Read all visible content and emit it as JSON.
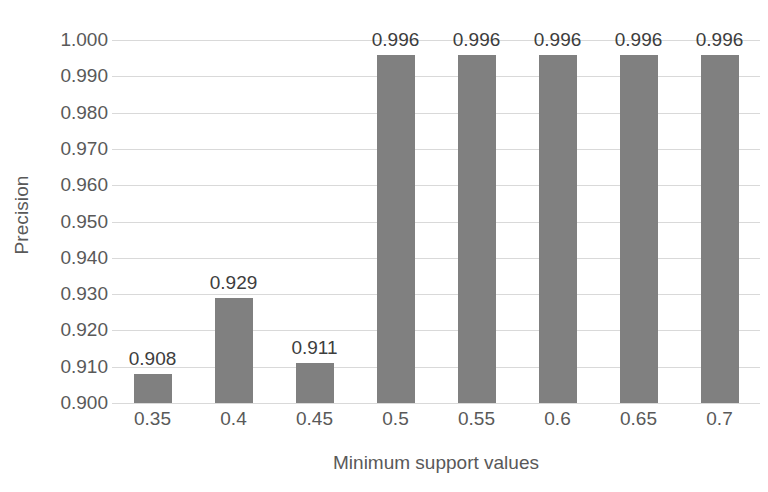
{
  "chart_data": {
    "type": "bar",
    "title": "",
    "xlabel": "Minimum support values",
    "ylabel": "Precision",
    "categories": [
      "0.35",
      "0.4",
      "0.45",
      "0.5",
      "0.55",
      "0.6",
      "0.65",
      "0.7"
    ],
    "values": [
      0.908,
      0.929,
      0.911,
      0.996,
      0.996,
      0.996,
      0.996,
      0.996
    ],
    "value_labels": [
      "0.908",
      "0.929",
      "0.911",
      "0.996",
      "0.996",
      "0.996",
      "0.996",
      "0.996"
    ],
    "ylim": [
      0.9,
      1.0
    ],
    "ytick_labels": [
      "1.000",
      "0.990",
      "0.980",
      "0.970",
      "0.960",
      "0.950",
      "0.940",
      "0.930",
      "0.920",
      "0.910",
      "0.900"
    ],
    "ytick_values": [
      1.0,
      0.99,
      0.98,
      0.97,
      0.96,
      0.95,
      0.94,
      0.93,
      0.92,
      0.91,
      0.9
    ],
    "grid": true,
    "legend": "none",
    "series_color": "#808080",
    "gridline_color": "#d9d9d9",
    "label_color": "#595959",
    "datalabel_color": "#3d3d3d",
    "background": "#ffffff"
  }
}
